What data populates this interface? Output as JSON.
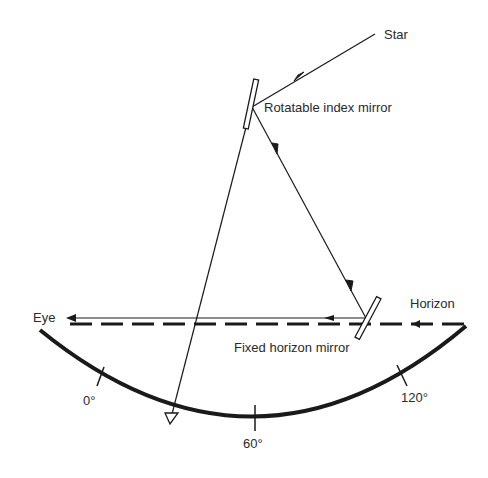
{
  "diagram": {
    "type": "sextant optical principle",
    "labels": {
      "star": "Star",
      "index_mirror": "Rotatable index mirror",
      "horizon": "Horizon",
      "horizon_mirror": "Fixed horizon mirror",
      "eye": "Eye"
    },
    "scale_ticks": [
      {
        "label": "0°"
      },
      {
        "label": "60°"
      },
      {
        "label": "120°"
      }
    ],
    "colors": {
      "line": "#1a1a1a",
      "text": "#2a2a2a",
      "background": "#ffffff"
    }
  }
}
